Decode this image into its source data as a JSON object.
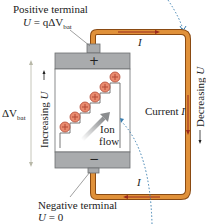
{
  "labels": {
    "positive_terminal": "Positive terminal",
    "positive_eq_lhs": "U",
    "positive_eq_mid": " = q",
    "positive_eq_delta": "ΔV",
    "positive_eq_sub": "bat",
    "negative_terminal": "Negative terminal",
    "negative_eq_lhs": "U",
    "negative_eq_rhs": " = 0",
    "delta_v": "ΔV",
    "delta_v_sub": "bat",
    "increasing_text": "Increasing ",
    "increasing_var": "U",
    "decreasing_text": "Decreasing ",
    "decreasing_var": "U",
    "current_text": "Current ",
    "current_var": "I",
    "top_current": "I",
    "bottom_current": "I",
    "ion_flow_line1": "Ion",
    "ion_flow_line2": "flow",
    "plus_sign": "+",
    "minus_sign": "−"
  },
  "colors": {
    "wire": "#d9822b",
    "wire_edge": "#8a4a12",
    "current_arrow": "#9b2a1e",
    "battery_cap": "#a9abad",
    "battery_body": "#ffffff",
    "ion": "#e98a6e",
    "ion_edge": "#b24a36",
    "dotted_path": "#3b7fb0"
  },
  "ions": {
    "count": 6,
    "symbol": "+"
  }
}
